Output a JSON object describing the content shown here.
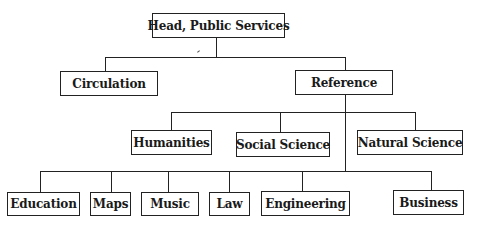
{
  "diagram": {
    "type": "org-chart",
    "root": {
      "label": "Head, Public Services",
      "children": [
        {
          "label": "Circulation"
        },
        {
          "label": "Reference",
          "children_level1": [
            "Humanities",
            "Social Science",
            "Natural Science"
          ],
          "children_level2": [
            "Education",
            "Maps",
            "Music",
            "Law",
            "Engineering",
            "Business"
          ]
        }
      ]
    }
  },
  "nodes": {
    "head": "Head, Public Services",
    "circulation": "Circulation",
    "reference": "Reference",
    "humanities": "Humanities",
    "social_science": "Social Science",
    "natural_science": "Natural Science",
    "education": "Education",
    "maps": "Maps",
    "music": "Music",
    "law": "Law",
    "engineering": "Engineering",
    "business": "Business"
  }
}
